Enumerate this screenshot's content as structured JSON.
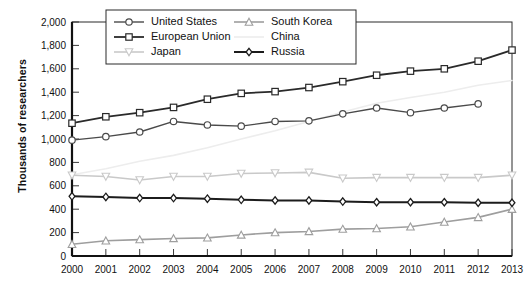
{
  "chart_data": {
    "type": "line",
    "title": "",
    "subtitle": "",
    "xlabel": "",
    "ylabel": "Thousands of researchers",
    "x": [
      2000,
      2001,
      2002,
      2003,
      2004,
      2005,
      2006,
      2007,
      2008,
      2009,
      2010,
      2011,
      2012,
      2013
    ],
    "categories": [
      "2000",
      "2001",
      "2002",
      "2003",
      "2004",
      "2005",
      "2006",
      "2007",
      "2008",
      "2009",
      "2010",
      "2011",
      "2012",
      "2013"
    ],
    "xlim": [
      2000,
      2013
    ],
    "ylim": [
      0,
      2000
    ],
    "ytick_values": [
      0,
      200,
      400,
      600,
      800,
      1000,
      1200,
      1400,
      1600,
      1800,
      2000
    ],
    "ytick_labels": [
      "0",
      "200",
      "400",
      "600",
      "800",
      "1,000",
      "1,200",
      "1,400",
      "1,600",
      "1,800",
      "2,000"
    ],
    "grid": false,
    "legend_position": "top-center-inside",
    "series": [
      {
        "name": "United States",
        "color": "#4a4a4a",
        "marker": "circle",
        "linewidth": 1.4,
        "values": [
          990,
          1020,
          1060,
          1150,
          1120,
          1110,
          1150,
          1155,
          1215,
          1265,
          1225,
          1265,
          1300,
          null
        ]
      },
      {
        "name": "European Union",
        "color": "#2a2a2a",
        "marker": "square",
        "linewidth": 1.8,
        "values": [
          1135,
          1190,
          1225,
          1270,
          1340,
          1390,
          1405,
          1440,
          1490,
          1545,
          1580,
          1600,
          1665,
          1760
        ]
      },
      {
        "name": "Japan",
        "color": "#c9c9c9",
        "marker": "triangle-down",
        "linewidth": 1.6,
        "values": [
          690,
          680,
          650,
          680,
          680,
          705,
          710,
          715,
          665,
          670,
          670,
          670,
          670,
          690
        ]
      },
      {
        "name": "South Korea",
        "color": "#9e9e9e",
        "marker": "triangle-up",
        "linewidth": 1.6,
        "values": [
          100,
          130,
          140,
          150,
          155,
          180,
          200,
          210,
          230,
          235,
          250,
          290,
          330,
          400
        ]
      },
      {
        "name": "China",
        "color": "#ededed",
        "marker": "none",
        "linewidth": 1.6,
        "values": [
          695,
          745,
          810,
          860,
          925,
          1000,
          1070,
          1150,
          1230,
          1305,
          1355,
          1400,
          1460,
          1500
        ]
      },
      {
        "name": "Russia",
        "color": "#1c1c1c",
        "marker": "diamond",
        "linewidth": 2.0,
        "values": [
          510,
          505,
          495,
          495,
          490,
          480,
          475,
          475,
          465,
          460,
          460,
          460,
          455,
          455
        ]
      }
    ],
    "legend_entries": [
      {
        "label": "United States",
        "column": 0
      },
      {
        "label": "European Union",
        "column": 0
      },
      {
        "label": "Japan",
        "column": 0
      },
      {
        "label": "South Korea",
        "column": 1
      },
      {
        "label": "China",
        "column": 1
      },
      {
        "label": "Russia",
        "column": 1
      }
    ]
  }
}
